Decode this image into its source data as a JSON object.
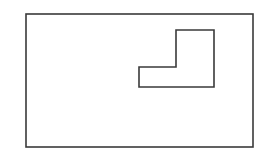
{
  "canvas": {
    "width": 270,
    "height": 161,
    "background": "#ffffff"
  },
  "stroke": {
    "color": "#3a3a3a",
    "width": 1.6
  },
  "shapes": {
    "outer_rectangle": {
      "x": 26,
      "y": 14,
      "width": 227,
      "height": 133
    },
    "l_shape": {
      "points": "176,30 214,30 214,87 139,87 139,67 176,67"
    }
  }
}
